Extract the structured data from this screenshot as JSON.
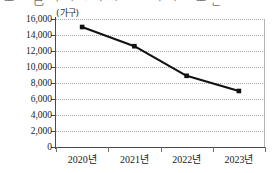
{
  "caption": {
    "text": "ᅩ ᄋ 已   ᅥ   ᅵ  ᄀ ᅡ  ᅵ ᄅ ᄅ ᅡ  ᅵ  ᄉ ᅩ ᆫ"
  },
  "chart_data": {
    "type": "line",
    "title": "",
    "unit_label": "(가구)",
    "categories": [
      "2020년",
      "2021년",
      "2022년",
      "2023년"
    ],
    "values": [
      15000,
      12600,
      8900,
      7000
    ],
    "series": [
      {
        "name": "가구 수",
        "values": [
          15000,
          12600,
          8900,
          7000
        ]
      }
    ],
    "xlabel": "",
    "ylabel": "(가구)",
    "ylim": [
      0,
      16000
    ],
    "ytick_step": 2000,
    "ytick_labels": [
      "16,000",
      "14,000",
      "12,000",
      "10,000",
      "8,000",
      "6,000",
      "4,000",
      "2,000",
      "0"
    ],
    "ytick_values": [
      16000,
      14000,
      12000,
      10000,
      8000,
      6000,
      4000,
      2000,
      0
    ],
    "grid": true,
    "grid_style": "dotted",
    "legend": false,
    "legend_position": "none",
    "marker": "square",
    "line_color": "#111111",
    "marker_color": "#111111",
    "grid_color": "#a8a8a8",
    "axis_color": "#4a4a4a",
    "annotations": []
  }
}
